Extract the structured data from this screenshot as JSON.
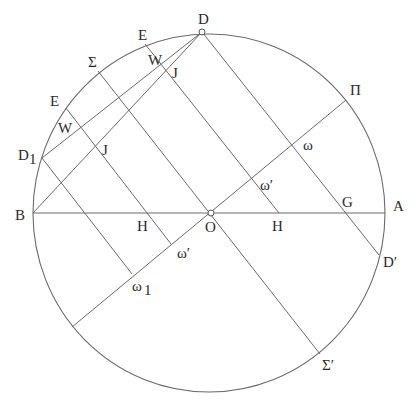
{
  "diagram": {
    "circle": {
      "cx": 209,
      "cy": 213,
      "rx": 176,
      "ry": 179
    },
    "segments": [
      {
        "name": "diameter-BA",
        "x1": 33,
        "y1": 213,
        "x2": 385,
        "y2": 213
      },
      {
        "name": "line-D-Dprime",
        "x1": 202,
        "y1": 32,
        "x2": 379,
        "y2": 255
      },
      {
        "name": "line-Pi-chord",
        "x1": 346,
        "y1": 100,
        "x2": 72,
        "y2": 327
      },
      {
        "name": "line-Sigma-Sigmaprime",
        "x1": 98,
        "y1": 71,
        "x2": 320,
        "y2": 354
      },
      {
        "name": "line-E-top-H",
        "x1": 145,
        "y1": 44,
        "x2": 279,
        "y2": 213
      },
      {
        "name": "line-E-left-omegaprime",
        "x1": 66,
        "y1": 108,
        "x2": 171,
        "y2": 244
      },
      {
        "name": "line-D1-omega1",
        "x1": 42,
        "y1": 158,
        "x2": 132,
        "y2": 274
      },
      {
        "name": "line-D-D1",
        "x1": 202,
        "y1": 32,
        "x2": 42,
        "y2": 158
      },
      {
        "name": "line-D-B",
        "x1": 202,
        "y1": 32,
        "x2": 33,
        "y2": 213
      }
    ],
    "points": [
      {
        "name": "point-D",
        "x": 202,
        "y": 32
      },
      {
        "name": "point-O",
        "x": 211,
        "y": 213
      }
    ],
    "labels": [
      {
        "name": "label-D",
        "text": "D",
        "x": 198,
        "y": 24
      },
      {
        "name": "label-E-top",
        "text": "E",
        "x": 138,
        "y": 40
      },
      {
        "name": "label-W-top",
        "text": "W",
        "x": 148,
        "y": 65
      },
      {
        "name": "label-J-top",
        "text": "J",
        "x": 172,
        "y": 78
      },
      {
        "name": "label-Sigma",
        "text": "Σ",
        "x": 88,
        "y": 67
      },
      {
        "name": "label-E-left",
        "text": "E",
        "x": 50,
        "y": 106
      },
      {
        "name": "label-W-left",
        "text": "W",
        "x": 58,
        "y": 133
      },
      {
        "name": "label-J-left",
        "text": "J",
        "x": 102,
        "y": 155
      },
      {
        "name": "label-D1",
        "text": "D",
        "x": 18,
        "y": 160
      },
      {
        "name": "label-D1-sub",
        "text": "1",
        "x": 29,
        "y": 164
      },
      {
        "name": "label-B",
        "text": "B",
        "x": 15,
        "y": 220
      },
      {
        "name": "label-H-left",
        "text": "H",
        "x": 137,
        "y": 231
      },
      {
        "name": "label-O",
        "text": "O",
        "x": 205,
        "y": 232
      },
      {
        "name": "label-H-right",
        "text": "H",
        "x": 272,
        "y": 231
      },
      {
        "name": "label-G",
        "text": "G",
        "x": 342,
        "y": 207
      },
      {
        "name": "label-A",
        "text": "A",
        "x": 393,
        "y": 211
      },
      {
        "name": "label-Pi",
        "text": "Π",
        "x": 350,
        "y": 95
      },
      {
        "name": "label-omega",
        "text": "ω",
        "x": 303,
        "y": 150
      },
      {
        "name": "label-omegaprime-upper",
        "text": "ω′",
        "x": 260,
        "y": 190
      },
      {
        "name": "label-omegaprime-lower",
        "text": "ω′",
        "x": 177,
        "y": 258
      },
      {
        "name": "label-omega1",
        "text": "ω",
        "x": 132,
        "y": 291
      },
      {
        "name": "label-omega1-sub",
        "text": "1",
        "x": 144,
        "y": 295
      },
      {
        "name": "label-Dprime",
        "text": "D′",
        "x": 383,
        "y": 267
      },
      {
        "name": "label-Sigmaprime",
        "text": "Σ′",
        "x": 322,
        "y": 370
      }
    ]
  }
}
